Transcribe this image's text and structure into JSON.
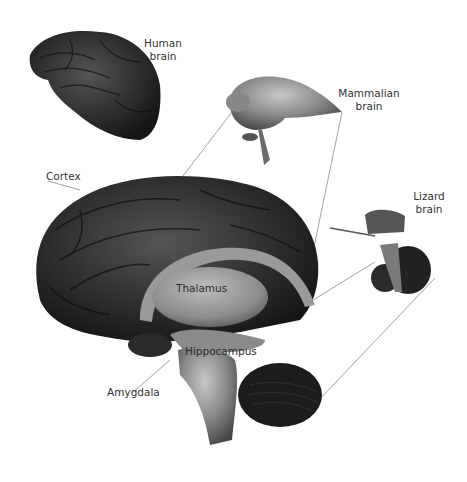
{
  "diagram": {
    "type": "brain evolution illustration (grayscale 3D renderings)",
    "labels": {
      "human_brain": [
        "Human",
        "brain"
      ],
      "mammalian_brain": [
        "Mammalian",
        "brain"
      ],
      "lizard_brain": [
        "Lizard",
        "brain"
      ],
      "cortex": "Cortex",
      "thalamus": "Thalamus",
      "hippocampus": "Hippocampus",
      "amygdala": "Amygdala"
    },
    "colors": {
      "background": "#ffffff",
      "brain_dark": "#2b2b2b",
      "brain_mid": "#6e6e6e",
      "brain_light": "#b5b5b5",
      "lines": "#8a8a8a",
      "text": "#333333"
    }
  }
}
